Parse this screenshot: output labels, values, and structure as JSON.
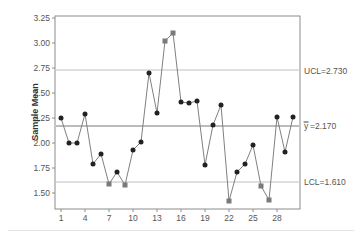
{
  "chart_data": {
    "type": "line",
    "title": "",
    "xlabel": "",
    "ylabel": "Sample Mean",
    "ylim": [
      1.32,
      3.25
    ],
    "xlim": [
      0.25,
      30.9
    ],
    "grid": false,
    "legend": "none",
    "x_ticks": [
      1,
      4,
      7,
      10,
      13,
      16,
      19,
      22,
      25,
      28
    ],
    "y_ticks": [
      "1.50",
      "1.75",
      "2.00",
      "2.25",
      "2.50",
      "2.75",
      "3.00",
      "3.25"
    ],
    "x": [
      1,
      2,
      3,
      4,
      5,
      6,
      7,
      8,
      9,
      10,
      11,
      12,
      13,
      14,
      15,
      16,
      17,
      18,
      19,
      20,
      21,
      22,
      23,
      24,
      25,
      26,
      27,
      28,
      29,
      30
    ],
    "series": [
      {
        "name": "Sample Mean",
        "values": [
          2.25,
          2.0,
          2.0,
          2.29,
          1.79,
          1.89,
          1.59,
          1.71,
          1.58,
          1.93,
          2.01,
          2.7,
          2.3,
          3.02,
          3.1,
          2.41,
          2.4,
          2.42,
          1.78,
          2.18,
          2.38,
          1.42,
          1.71,
          1.79,
          1.98,
          1.57,
          1.43,
          2.26,
          1.91,
          2.26
        ],
        "out_of_control": [
          7,
          9,
          14,
          15,
          22,
          26,
          27
        ]
      }
    ],
    "control_limits": {
      "ucl": 2.73,
      "center": 2.17,
      "lcl": 1.61
    },
    "annotations": {
      "ucl_label": "UCL=2.730",
      "center_label": "y=2.170",
      "center_symbol": "y̿",
      "center_value": "=2.170",
      "lcl_label": "LCL=1.610"
    }
  },
  "colors": {
    "line": "#808080",
    "marker": "#222222",
    "flagged_marker": "#7a7a7a",
    "center_line": "#555555",
    "limit_line": "#b0b0b0",
    "axis": "#8c8c8c",
    "text": "#555555"
  }
}
